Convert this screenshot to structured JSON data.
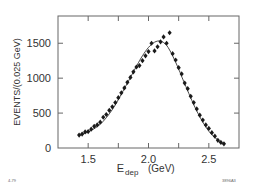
{
  "chart_data": {
    "type": "scatter",
    "title": "",
    "xlabel": "E_dep (GeV)",
    "xlabel_main": "E",
    "xlabel_sub": "dep",
    "xlabel_unit": "(GeV)",
    "ylabel": "EVENTS/(0.025 GeV)",
    "xlim": [
      1.25,
      2.75
    ],
    "ylim": [
      0,
      1890
    ],
    "x_ticks": [
      1.5,
      1.75,
      2.0,
      2.25,
      2.5
    ],
    "x_tick_labels": [
      "1.5",
      "",
      "2.0",
      "",
      "2.5"
    ],
    "y_ticks": [
      0,
      500,
      1000,
      1500
    ],
    "y_tick_labels": [
      "0",
      "500",
      "1000",
      "1500"
    ],
    "grid": false,
    "legend": null,
    "annotations": [
      "4-79",
      "3896A3"
    ],
    "series": [
      {
        "name": "data",
        "style": "diamond-markers",
        "x": [
          1.425,
          1.45,
          1.475,
          1.5,
          1.525,
          1.55,
          1.575,
          1.6,
          1.625,
          1.65,
          1.675,
          1.7,
          1.725,
          1.75,
          1.775,
          1.8,
          1.825,
          1.85,
          1.875,
          1.9,
          1.925,
          1.95,
          1.975,
          2.0,
          2.025,
          2.05,
          2.075,
          2.1,
          2.125,
          2.15,
          2.175,
          2.2,
          2.225,
          2.25,
          2.275,
          2.3,
          2.325,
          2.35,
          2.375,
          2.4,
          2.425,
          2.45,
          2.475,
          2.5,
          2.525,
          2.55,
          2.575,
          2.6,
          2.625
        ],
        "values": [
          185,
          200,
          230,
          235,
          270,
          310,
          330,
          370,
          440,
          480,
          540,
          590,
          650,
          720,
          790,
          860,
          940,
          1010,
          1090,
          1160,
          1180,
          1250,
          1320,
          1380,
          1500,
          1390,
          1450,
          1520,
          1590,
          1500,
          1650,
          1350,
          1260,
          1150,
          1060,
          930,
          850,
          740,
          650,
          560,
          470,
          400,
          330,
          280,
          220,
          170,
          110,
          80,
          60
        ]
      },
      {
        "name": "fit",
        "style": "line",
        "x": [
          1.425,
          1.5,
          1.6,
          1.7,
          1.8,
          1.9,
          1.95,
          2.0,
          2.05,
          2.1,
          2.15,
          2.2,
          2.25,
          2.3,
          2.4,
          2.5,
          2.6,
          2.625
        ],
        "values": [
          180,
          230,
          340,
          550,
          850,
          1170,
          1320,
          1440,
          1515,
          1530,
          1470,
          1320,
          1130,
          920,
          530,
          240,
          80,
          55
        ]
      }
    ]
  },
  "labels": {
    "y_title": "EVENTS/(0.025 GeV)",
    "x_title_main": "E",
    "x_title_sub": "dep",
    "x_title_unit": "(GeV)",
    "corner_left": "4-79",
    "corner_right": "3896A3"
  }
}
